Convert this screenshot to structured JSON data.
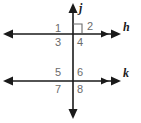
{
  "figure": {
    "canvas": {
      "width": 141,
      "height": 123
    },
    "colors": {
      "line": "#1a1a1a",
      "angle_label": "#6b6b6b",
      "line_label": "#1a1a1a",
      "right_angle_mark": "#6b6b6b",
      "background": "#ffffff"
    },
    "lines": [
      {
        "name": "j",
        "label": "j",
        "orientation": "vertical",
        "label_x": 79,
        "label_y": 3,
        "x": 73,
        "y1": 4,
        "y2": 119
      },
      {
        "name": "h",
        "label": "h",
        "orientation": "horizontal",
        "label_x": 124,
        "label_y": 22,
        "y": 34,
        "x1": 4,
        "x2": 121
      },
      {
        "name": "k",
        "label": "k",
        "orientation": "horizontal",
        "label_x": 124,
        "label_y": 68,
        "y": 81,
        "x1": 4,
        "x2": 121
      }
    ],
    "angles": [
      {
        "number": "1",
        "x": 58,
        "y": 23,
        "intersection": "upper",
        "quadrant": "upper-left"
      },
      {
        "number": "2",
        "x": 84,
        "y": 21,
        "intersection": "upper",
        "quadrant": "upper-right"
      },
      {
        "number": "3",
        "x": 58,
        "y": 37,
        "intersection": "upper",
        "quadrant": "lower-left"
      },
      {
        "number": "4",
        "x": 76,
        "y": 37,
        "intersection": "upper",
        "quadrant": "lower-right"
      },
      {
        "number": "5",
        "x": 58,
        "y": 69,
        "intersection": "lower",
        "quadrant": "upper-left"
      },
      {
        "number": "6",
        "x": 76,
        "y": 69,
        "intersection": "lower",
        "quadrant": "upper-right"
      },
      {
        "number": "7",
        "x": 58,
        "y": 84,
        "intersection": "lower",
        "quadrant": "lower-left"
      },
      {
        "number": "8",
        "x": 76,
        "y": 84,
        "intersection": "lower",
        "quadrant": "lower-right"
      }
    ],
    "right_angle_marker": {
      "at_angle": "2",
      "x": 73,
      "y": 24,
      "size": 9,
      "description": "square marker indicating angle 2 is a right angle"
    }
  }
}
